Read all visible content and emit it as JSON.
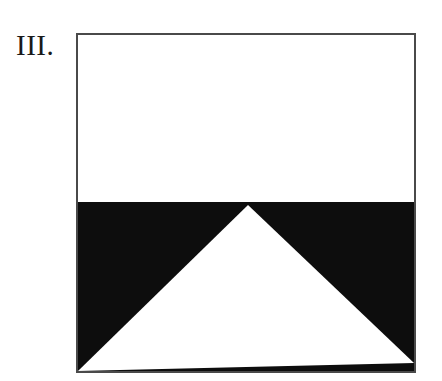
{
  "figure": {
    "label": "III.",
    "background_color": "#ffffff",
    "fill_color": "#0d0d0d",
    "border_color": "#4a4a4a",
    "border_width_px": 2,
    "frame": {
      "x": 77,
      "y": 34,
      "width": 338,
      "height": 338
    },
    "shapes": {
      "upper_band": {
        "name": "upper-white-band",
        "fill": "#ffffff",
        "top_y": 34,
        "bottom_y": 202
      },
      "lower_band": {
        "name": "lower-black-band",
        "fill": "#0d0d0d",
        "top_y": 202,
        "bottom_y": 372
      },
      "white_triangle": {
        "name": "white-triangle",
        "fill": "#ffffff",
        "apex": {
          "x": 248,
          "y": 205
        },
        "base_left": {
          "x": 78,
          "y": 371
        },
        "base_right": {
          "x": 414,
          "y": 363
        }
      }
    }
  }
}
